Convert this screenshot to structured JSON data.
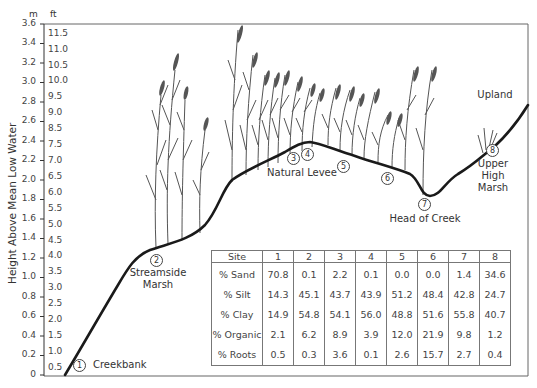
{
  "axis": {
    "y_label": "Height Above Mean Low Water",
    "unit_m": "m",
    "unit_ft": "ft",
    "m_ticks": [
      "3.6",
      "3.4",
      "3.2",
      "3.0",
      "2.8",
      "2.6",
      "2.4",
      "2.2",
      "2.0",
      "1.8",
      "1.6",
      "1.4",
      "1.2",
      "1.0",
      "0.8",
      "0.6",
      "0.4",
      "0.2",
      "0"
    ],
    "ft_ticks": [
      "11.5",
      "11.0",
      "10.5",
      "10.0",
      "9.5",
      "9.0",
      "8.5",
      "7.5",
      "7.0",
      "6.5",
      "6.0",
      "5.5",
      "5.0",
      "4.5",
      "4.0",
      "3.5",
      "3.0",
      "2.5",
      "2.0",
      "1.5",
      "1.0",
      "0.5"
    ]
  },
  "sites": [
    {
      "num": "1",
      "label": "Creekbank"
    },
    {
      "num": "2",
      "label": "Streamside Marsh"
    },
    {
      "num": "3",
      "label": ""
    },
    {
      "num": "4",
      "label": "Natural Levee"
    },
    {
      "num": "5",
      "label": ""
    },
    {
      "num": "6",
      "label": ""
    },
    {
      "num": "7",
      "label": "Head of Creek"
    },
    {
      "num": "8",
      "label": "Upper High Marsh"
    }
  ],
  "labels": {
    "creekbank": "Creekbank",
    "streamside_1": "Streamside",
    "streamside_2": "Marsh",
    "natural_levee": "Natural Levee",
    "head_of_creek": "Head of Creek",
    "upper_1": "Upper",
    "upper_2": "High",
    "upper_3": "Marsh",
    "upland": "Upland"
  },
  "table": {
    "header": [
      "Site",
      "1",
      "2",
      "3",
      "4",
      "5",
      "6",
      "7",
      "8"
    ],
    "rows": [
      {
        "label": "% Sand",
        "values": [
          "70.8",
          "0.1",
          "2.2",
          "0.1",
          "0.0",
          "0.0",
          "1.4",
          "34.6"
        ]
      },
      {
        "label": "% Silt",
        "values": [
          "14.3",
          "45.1",
          "43.7",
          "43.9",
          "51.2",
          "48.4",
          "42.8",
          "24.7"
        ]
      },
      {
        "label": "% Clay",
        "values": [
          "14.9",
          "54.8",
          "54.1",
          "56.0",
          "48.8",
          "51.6",
          "55.8",
          "40.7"
        ]
      },
      {
        "label": "% Organic",
        "values": [
          "2.1",
          "6.2",
          "8.9",
          "3.9",
          "12.0",
          "21.9",
          "9.8",
          "1.2"
        ]
      },
      {
        "label": "% Roots",
        "values": [
          "0.5",
          "0.3",
          "3.6",
          "0.1",
          "2.6",
          "15.7",
          "2.7",
          "0.4"
        ]
      }
    ]
  },
  "colors": {
    "profile_line": "#1a1a1a",
    "plants": "#555555",
    "frame": "#666666"
  }
}
